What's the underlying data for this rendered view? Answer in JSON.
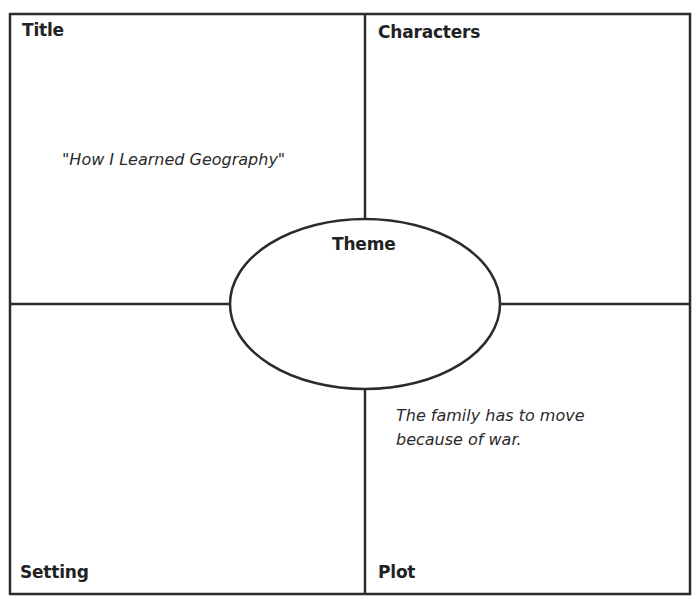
{
  "organizer": {
    "quadrants": {
      "top_left": {
        "label": "Title",
        "content": "\"How I Learned Geography\""
      },
      "top_right": {
        "label": "Characters",
        "content": ""
      },
      "bottom_left": {
        "label": "Setting",
        "content": ""
      },
      "bottom_right": {
        "label": "Plot",
        "content_lines": [
          "The family has to move",
          "because of war."
        ]
      }
    },
    "center": {
      "label": "Theme",
      "content": ""
    }
  },
  "colors": {
    "line": "#2b2b2b",
    "background": "#ffffff",
    "text": "#222222"
  }
}
